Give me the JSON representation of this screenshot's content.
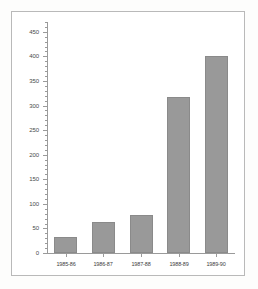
{
  "chart_data": {
    "type": "bar",
    "title": "",
    "subtitle": "",
    "xlabel": "",
    "ylabel": "",
    "categories": [
      "1985-86",
      "1986-87",
      "1987-88",
      "1988-89",
      "1989-90"
    ],
    "values": [
      33,
      64,
      78,
      317,
      401
    ],
    "series": [
      {
        "name": "",
        "values": [
          33,
          64,
          78,
          317,
          401
        ]
      }
    ],
    "ylim": [
      0,
      470
    ],
    "ytick_labels": [
      "0",
      "50",
      "100",
      "150",
      "200",
      "250",
      "300",
      "350",
      "400",
      "450"
    ],
    "ytick_values": [
      0,
      50,
      100,
      150,
      200,
      250,
      300,
      350,
      400,
      450
    ],
    "yminor_interval": 10,
    "grid": false,
    "legend": null,
    "legend_position": "none",
    "annotations": [],
    "bar_color": "#999999",
    "bar_border_color": "#8a8a8a",
    "axis_color": "#9a9a9a",
    "plot_background": "#ffffff",
    "frame_border_color": "#b9b9b9",
    "figure_background": "#fdfdfc"
  }
}
